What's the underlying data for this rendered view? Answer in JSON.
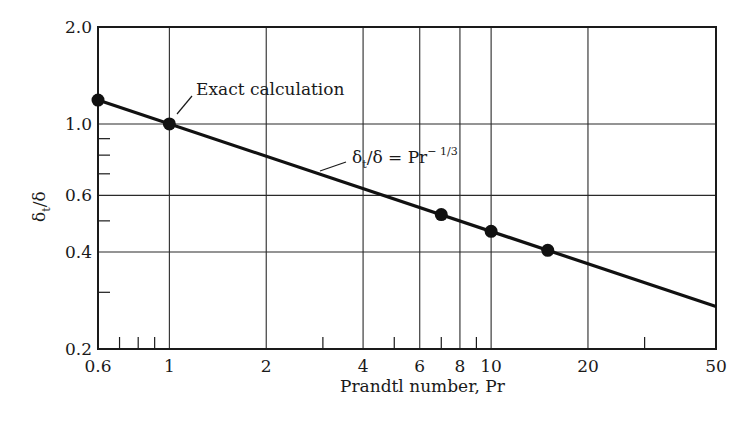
{
  "chart_data": {
    "type": "line",
    "title": "",
    "xlabel": "Prandtl number, Pr",
    "ylabel": "δt/δ",
    "xscale": "log",
    "yscale": "log",
    "xlim": [
      0.6,
      50
    ],
    "ylim": [
      0.2,
      2.0
    ],
    "grid": true,
    "x_tick_labels": [
      "0.6",
      "1",
      "2",
      "4",
      "6",
      "8",
      "10",
      "20",
      "50"
    ],
    "x_ticks": [
      0.6,
      1,
      2,
      4,
      6,
      8,
      10,
      20,
      50
    ],
    "x_gridlines": [
      1,
      2,
      4,
      6,
      8,
      10,
      20
    ],
    "x_minor_ticks": [
      0.7,
      0.8,
      0.9,
      3,
      5,
      7,
      9,
      30
    ],
    "y_tick_labels": [
      "0.2",
      "0.4",
      "0.6",
      "1.0",
      "2.0"
    ],
    "y_ticks": [
      0.2,
      0.4,
      0.6,
      1.0,
      2.0
    ],
    "y_gridlines": [
      0.4,
      0.6,
      1.0
    ],
    "y_minor_ticks": [
      0.3,
      0.5,
      0.7,
      0.8,
      0.9
    ],
    "series": [
      {
        "name": "δt/δ = Pr^-1/3",
        "kind": "line",
        "x": [
          0.6,
          50
        ],
        "y": [
          1.186,
          0.271
        ]
      },
      {
        "name": "Exact calculation",
        "kind": "points",
        "x": [
          0.6,
          1,
          7,
          10,
          15
        ],
        "y": [
          1.186,
          1.0,
          0.523,
          0.464,
          0.405
        ]
      }
    ],
    "annotations": [
      {
        "text": "Exact calculation",
        "points_to": [
          1,
          1.0
        ]
      },
      {
        "text_main": "δt/δ = Pr",
        "text_sup": "− 1/3",
        "points_to": [
          3.8,
          0.64
        ]
      }
    ]
  },
  "labels": {
    "xlabel": "Prandtl number, Pr",
    "ylabel_main": "δ",
    "ylabel_sub": "t",
    "ylabel_rest": "/δ",
    "exact": "Exact calculation",
    "formula_delta": "δ",
    "formula_sub": "t",
    "formula_rest": "/δ  =  Pr",
    "formula_sup": "− 1/3"
  }
}
